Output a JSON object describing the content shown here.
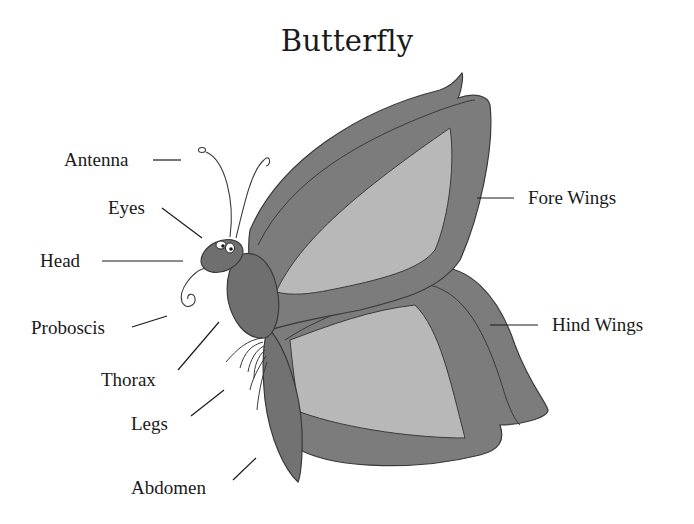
{
  "diagram": {
    "title": "Butterfly",
    "colors": {
      "wing_dark": "#7c7c7c",
      "wing_light": "#b6b6b6",
      "body": "#6f6f6f",
      "outline": "#3a3a3a",
      "text": "#1a1a1a",
      "background": "#ffffff"
    },
    "labels": [
      {
        "id": "antenna",
        "text": "Antenna"
      },
      {
        "id": "eyes",
        "text": "Eyes"
      },
      {
        "id": "head",
        "text": "Head"
      },
      {
        "id": "proboscis",
        "text": "Proboscis"
      },
      {
        "id": "thorax",
        "text": "Thorax"
      },
      {
        "id": "legs",
        "text": "Legs"
      },
      {
        "id": "abdomen",
        "text": "Abdomen"
      },
      {
        "id": "fore_wings",
        "text": "Fore Wings"
      },
      {
        "id": "hind_wings",
        "text": "Hind Wings"
      }
    ]
  }
}
